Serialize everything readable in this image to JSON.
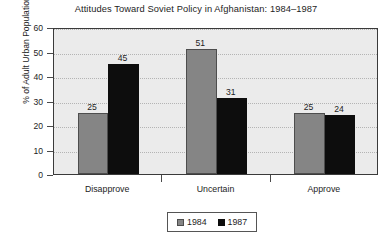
{
  "chart_data": {
    "type": "bar",
    "title": "Attitudes Toward Soviet Policy in Afghanistan: 1984–1987",
    "xlabel": "",
    "ylabel": "% of Adult Urban Population",
    "categories": [
      "Disapprove",
      "Uncertain",
      "Approve"
    ],
    "series": [
      {
        "name": "1984",
        "color": "#858585",
        "values": [
          25,
          51,
          25
        ]
      },
      {
        "name": "1987",
        "color": "#0d0d0d",
        "values": [
          45,
          31,
          24
        ]
      }
    ],
    "ylim": [
      0,
      60
    ],
    "yticks": [
      0,
      10,
      20,
      30,
      40,
      50,
      60
    ],
    "ytick_labels": [
      "0",
      "10",
      "20",
      "30",
      "40",
      "50",
      "60"
    ],
    "grid": true,
    "grid_axis": "y",
    "legend_position": "bottom-center",
    "data_labels": true,
    "plot_background": "#ebebeb",
    "page_background": "#ffffff"
  }
}
